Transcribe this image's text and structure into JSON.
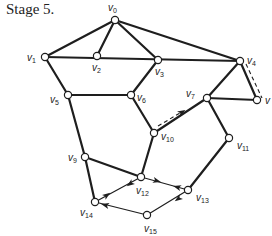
{
  "title": "Stage 5.",
  "vertices": [
    {
      "id": "v0",
      "name": "v",
      "sub": "0",
      "x": 115,
      "y": 20,
      "lx": 108,
      "ly": 11
    },
    {
      "id": "v1",
      "name": "v",
      "sub": "1",
      "x": 45,
      "y": 57,
      "lx": 27,
      "ly": 61
    },
    {
      "id": "v2",
      "name": "v",
      "sub": "2",
      "x": 97,
      "y": 56,
      "lx": 92,
      "ly": 71
    },
    {
      "id": "v3",
      "name": "v",
      "sub": "3",
      "x": 158,
      "y": 60,
      "lx": 155,
      "ly": 75
    },
    {
      "id": "v4",
      "name": "v",
      "sub": "4",
      "x": 240,
      "y": 61,
      "lx": 247,
      "ly": 64
    },
    {
      "id": "v5",
      "name": "v",
      "sub": "5",
      "x": 68,
      "y": 95,
      "lx": 50,
      "ly": 103
    },
    {
      "id": "v6",
      "name": "v",
      "sub": "6",
      "x": 131,
      "y": 95,
      "lx": 137,
      "ly": 101
    },
    {
      "id": "v7",
      "name": "v",
      "sub": "7",
      "x": 207,
      "y": 98,
      "lx": 186,
      "ly": 97
    },
    {
      "id": "v8",
      "name": "v",
      "sub": "",
      "x": 257,
      "y": 100,
      "lx": 265,
      "ly": 104
    },
    {
      "id": "v9",
      "name": "v",
      "sub": "9",
      "x": 85,
      "y": 157,
      "lx": 68,
      "ly": 161
    },
    {
      "id": "v10",
      "name": "v",
      "sub": "10",
      "x": 154,
      "y": 133,
      "lx": 161,
      "ly": 140
    },
    {
      "id": "v11",
      "name": "v",
      "sub": "11",
      "x": 229,
      "y": 138,
      "lx": 237,
      "ly": 149
    },
    {
      "id": "v12",
      "name": "v",
      "sub": "12",
      "x": 141,
      "y": 177,
      "lx": 136,
      "ly": 194
    },
    {
      "id": "v13",
      "name": "v",
      "sub": "13",
      "x": 188,
      "y": 190,
      "lx": 196,
      "ly": 201
    },
    {
      "id": "v14",
      "name": "v",
      "sub": "14",
      "x": 95,
      "y": 202,
      "lx": 80,
      "ly": 216
    },
    {
      "id": "v15",
      "name": "v",
      "sub": "15",
      "x": 147,
      "y": 215,
      "lx": 144,
      "ly": 232
    }
  ],
  "edges": [
    {
      "from": "v0",
      "to": "v1"
    },
    {
      "from": "v0",
      "to": "v2"
    },
    {
      "from": "v0",
      "to": "v3"
    },
    {
      "from": "v0",
      "to": "v4"
    },
    {
      "from": "v1",
      "to": "v4"
    },
    {
      "from": "v1",
      "to": "v5"
    },
    {
      "from": "v3",
      "to": "v6"
    },
    {
      "from": "v5",
      "to": "v6"
    },
    {
      "from": "v5",
      "to": "v9"
    },
    {
      "from": "v6",
      "to": "v10"
    },
    {
      "from": "v4",
      "to": "v7"
    },
    {
      "from": "v4",
      "to": "v8"
    },
    {
      "from": "v7",
      "to": "v8"
    },
    {
      "from": "v7",
      "to": "v10"
    },
    {
      "from": "v7",
      "to": "v11"
    },
    {
      "from": "v11",
      "to": "v13"
    },
    {
      "from": "v10",
      "to": "v12"
    },
    {
      "from": "v9",
      "to": "v12"
    },
    {
      "from": "v9",
      "to": "v14"
    },
    {
      "from": "v12",
      "to": "v13",
      "style": "thin"
    },
    {
      "from": "v12",
      "to": "v14",
      "style": "thin"
    },
    {
      "from": "v14",
      "to": "v15",
      "style": "thin"
    },
    {
      "from": "v13",
      "to": "v15",
      "style": "thin"
    }
  ],
  "dashed_paths": [
    {
      "id": "v4-v8-dashed",
      "x1": 246,
      "y1": 64,
      "x2": 262,
      "y2": 98
    },
    {
      "id": "v10-v7-dashed",
      "x1": 158,
      "y1": 126,
      "x2": 180,
      "y2": 113
    }
  ],
  "arrows": [
    {
      "x": 157,
      "y": 181,
      "angle": 16
    },
    {
      "x": 177,
      "y": 187,
      "angle": 196
    },
    {
      "x": 107,
      "y": 195,
      "angle": -36
    },
    {
      "x": 130,
      "y": 184,
      "angle": 144
    },
    {
      "x": 105,
      "y": 205,
      "angle": 194
    },
    {
      "x": 178,
      "y": 199,
      "angle": 144
    },
    {
      "x": 182,
      "y": 112,
      "angle": -31
    }
  ]
}
